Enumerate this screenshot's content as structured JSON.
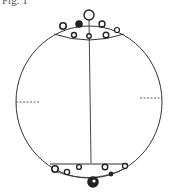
{
  "figure": {
    "caption": "Fig. 1",
    "stroke_color": "#333333",
    "background": "#ffffff"
  },
  "diagram": {
    "shape": "sphere-outline",
    "components": [
      {
        "name": "outer-circle"
      },
      {
        "name": "central-axis-line"
      },
      {
        "name": "top-cap-chord"
      },
      {
        "name": "bottom-cap-chord"
      },
      {
        "name": "left-dashed-marker"
      },
      {
        "name": "right-dashed-marker"
      },
      {
        "name": "top-particles",
        "count": 9
      },
      {
        "name": "bottom-particles",
        "count": 9
      }
    ]
  }
}
